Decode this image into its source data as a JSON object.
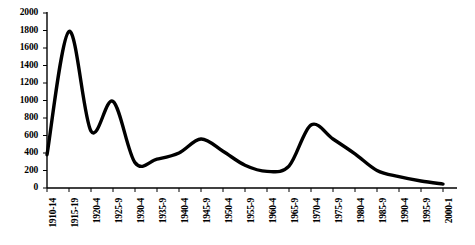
{
  "chart_data": {
    "type": "line",
    "title": "",
    "subtitle": "",
    "xlabel": "",
    "ylabel": "",
    "categories": [
      "1910-14",
      "1915-19",
      "1920-4",
      "1925-9",
      "1930-4",
      "1935-9",
      "1940-4",
      "1945-9",
      "1950-4",
      "1955-9",
      "1960-4",
      "1965-9",
      "1970-4",
      "1975-9",
      "1980-4",
      "1985-9",
      "1990-4",
      "1995-9",
      "2000-1"
    ],
    "values": [
      380,
      1790,
      650,
      990,
      290,
      330,
      400,
      560,
      420,
      260,
      190,
      250,
      720,
      560,
      390,
      200,
      130,
      80,
      45
    ],
    "yticks": [
      0,
      200,
      400,
      600,
      800,
      1000,
      1200,
      1400,
      1600,
      1800,
      2000
    ],
    "ytick_labels": [
      "0",
      "200",
      "400",
      "600",
      "800",
      "1000",
      "1200",
      "1400",
      "1600",
      "1800",
      "2000"
    ],
    "ylim": [
      0,
      2000
    ],
    "grid": false,
    "legend": false,
    "legend_position": "none",
    "series_color": "#000000",
    "axis_color": "#000000",
    "background_color": "#ffffff",
    "line_width": 3.4,
    "smoothing": "spline",
    "annotations": []
  }
}
